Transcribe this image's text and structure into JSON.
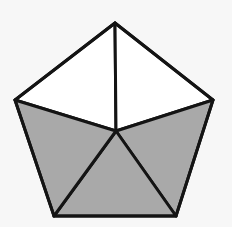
{
  "figure": {
    "shape": "pentagon",
    "background_color": "#f7f7f7",
    "stroke_color": "#141414",
    "shaded_color": "#a9a9a9",
    "unshaded_color": "#ffffff",
    "stroke_width": 3,
    "vertices": {
      "top": [
        115,
        23
      ],
      "right": [
        213,
        100
      ],
      "bottom_right": [
        176,
        216
      ],
      "bottom_left": [
        54,
        216
      ],
      "left": [
        15,
        100
      ]
    },
    "center": [
      116,
      131
    ],
    "triangles": [
      {
        "name": "top-left",
        "points": [
          "top",
          "left",
          "center"
        ],
        "shaded": false
      },
      {
        "name": "top-right",
        "points": [
          "top",
          "right",
          "center"
        ],
        "shaded": false
      },
      {
        "name": "right",
        "points": [
          "right",
          "bottom_right",
          "center"
        ],
        "shaded": true
      },
      {
        "name": "bottom",
        "points": [
          "bottom_right",
          "bottom_left",
          "center"
        ],
        "shaded": true
      },
      {
        "name": "left",
        "points": [
          "bottom_left",
          "left",
          "center"
        ],
        "shaded": true
      }
    ],
    "total_parts": 5,
    "shaded_parts": 3
  }
}
